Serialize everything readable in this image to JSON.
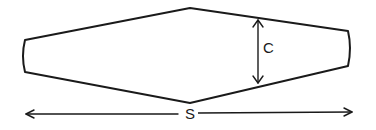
{
  "diagram": {
    "shape": "elongated hexagonal blade/strut cross-section (tapered both ends)",
    "labels": {
      "chord": "C",
      "span": "S"
    },
    "colors": {
      "line": "#1a1a1a",
      "background": "#ffffff"
    },
    "dimensions": [
      {
        "name": "C",
        "meaning": "max width / chord at center",
        "orientation": "vertical",
        "arrowheads": "both"
      },
      {
        "name": "S",
        "meaning": "overall span / length",
        "orientation": "horizontal",
        "arrowheads": "both"
      }
    ]
  }
}
